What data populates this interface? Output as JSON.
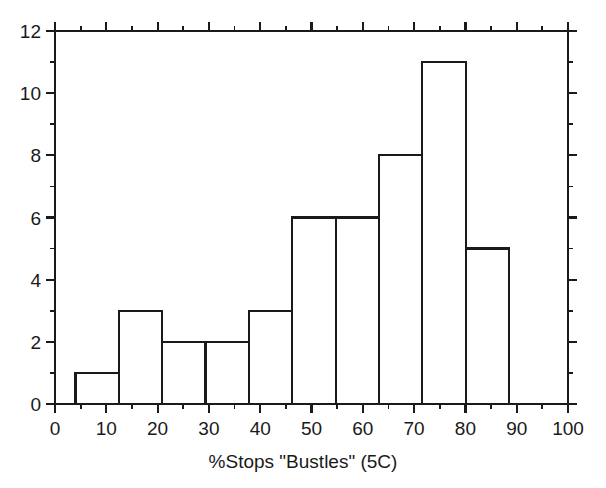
{
  "figure": {
    "width": 606,
    "height": 488,
    "background": "#ffffff",
    "line_color": "#1a1a1a",
    "text_color": "#1a1a1a"
  },
  "chart_data": {
    "type": "bar",
    "subtype": "histogram",
    "title": "",
    "subtitle": "",
    "xlabel": "%Stops \"Bustles\" (5C)",
    "ylabel": "",
    "xlim": [
      0,
      100
    ],
    "ylim": [
      0,
      12
    ],
    "grid": false,
    "legend": null,
    "legend_position": "none",
    "x_major_ticks": [
      0,
      10,
      20,
      30,
      40,
      50,
      60,
      70,
      80,
      90,
      100
    ],
    "x_tick_labels": [
      "0",
      "10",
      "20",
      "30",
      "40",
      "50",
      "60",
      "70",
      "80",
      "90",
      "100"
    ],
    "x_minor_step": 5,
    "y_major_ticks": [
      0,
      2,
      4,
      6,
      8,
      10,
      12
    ],
    "y_tick_labels": [
      "0",
      "2",
      "4",
      "6",
      "8",
      "10",
      "12"
    ],
    "y_minor_step": 1,
    "bin_edges": [
      4.0,
      12.45,
      20.9,
      29.35,
      37.8,
      46.25,
      54.7,
      63.15,
      71.6,
      80.05,
      88.5,
      96.95
    ],
    "bins": [
      {
        "x0": 4.0,
        "x1": 12.45,
        "count": 1
      },
      {
        "x0": 12.45,
        "x1": 20.9,
        "count": 3
      },
      {
        "x0": 20.9,
        "x1": 29.35,
        "count": 2
      },
      {
        "x0": 29.35,
        "x1": 37.8,
        "count": 2
      },
      {
        "x0": 37.8,
        "x1": 46.25,
        "count": 3
      },
      {
        "x0": 46.25,
        "x1": 54.7,
        "count": 6
      },
      {
        "x0": 54.7,
        "x1": 63.15,
        "count": 6
      },
      {
        "x0": 63.15,
        "x1": 71.6,
        "count": 8
      },
      {
        "x0": 71.6,
        "x1": 80.05,
        "count": 11
      },
      {
        "x0": 80.05,
        "x1": 88.5,
        "count": 5
      }
    ],
    "categories": [
      "4-12.45",
      "12.45-20.9",
      "20.9-29.35",
      "29.35-37.8",
      "37.8-46.25",
      "46.25-54.7",
      "54.7-63.15",
      "63.15-71.6",
      "71.6-80.05",
      "80.05-88.5"
    ],
    "values": [
      1,
      3,
      2,
      2,
      3,
      6,
      6,
      8,
      11,
      5
    ],
    "bar_fill": "none",
    "bar_edge_color": "#1a1a1a",
    "annotations": []
  },
  "axes": {
    "frame": "box",
    "tick_direction": "out",
    "plot_left": 55,
    "plot_right": 568,
    "plot_top": 31,
    "plot_bottom": 404
  }
}
